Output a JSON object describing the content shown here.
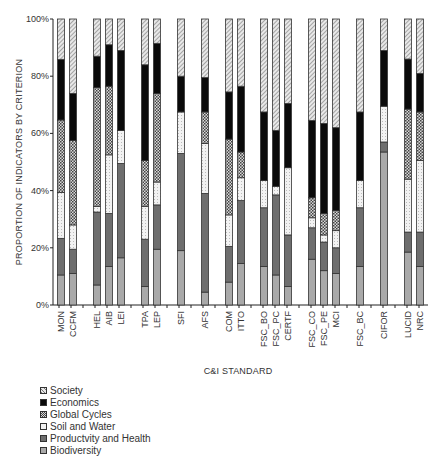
{
  "chart_data": {
    "type": "bar",
    "stacked": true,
    "normalized": true,
    "title": "",
    "xlabel": "C&I STANDARD",
    "ylabel": "PROPORTION OF INDICATORS BY CRITERION",
    "ylim": [
      0,
      100
    ],
    "yticks": [
      "0%",
      "20%",
      "40%",
      "60%",
      "80%",
      "100%"
    ],
    "grid": false,
    "legend_position": "bottom-left",
    "categories": [
      "MON",
      "CCFM",
      "HEL",
      "AIB",
      "LEI",
      "TPA",
      "LEP",
      "SFI",
      "AFS",
      "COM",
      "ITTO",
      "FSC_BO",
      "FSC_PC",
      "CERTF",
      "FSC_CO",
      "FSC_PE",
      "MCI",
      "FSC_BC",
      "CIFOR",
      "LUCID",
      "NRC"
    ],
    "series": [
      {
        "name": "Biodiversity",
        "values": [
          10.5,
          11,
          7,
          13.5,
          16.5,
          6.5,
          19.5,
          19,
          4.5,
          8,
          14.5,
          13.5,
          10.5,
          6.5,
          16,
          12,
          11,
          13.5,
          53.5,
          18.5,
          13.5
        ]
      },
      {
        "name": "Productvity and Health",
        "values": [
          12.8,
          8.5,
          25.5,
          18.5,
          33,
          16.5,
          15.5,
          34,
          34.5,
          12.5,
          22,
          20.5,
          28,
          18,
          11,
          10,
          9,
          20.5,
          3.5,
          7,
          12
        ]
      },
      {
        "name": "Soil and Water",
        "values": [
          16,
          8.5,
          2,
          20.5,
          11.5,
          11.5,
          8,
          14.5,
          17.5,
          11,
          8,
          9.5,
          3,
          23.5,
          3.5,
          2.5,
          6,
          9.5,
          12.5,
          18.5,
          25
        ]
      },
      {
        "name": "Global Cycles",
        "values": [
          25.4,
          29.5,
          41.5,
          24,
          0,
          16,
          31,
          0,
          11,
          26.5,
          9,
          0,
          0,
          0,
          7,
          7.5,
          7,
          0,
          0,
          24.5,
          17
        ]
      },
      {
        "name": "Economics",
        "values": [
          21.2,
          16.5,
          11,
          14.5,
          28,
          33.5,
          17.5,
          12.5,
          12,
          16.5,
          23,
          24,
          19.5,
          22.5,
          27,
          31.5,
          29,
          24,
          19.5,
          17.5,
          13.5
        ]
      },
      {
        "name": "Society",
        "values": [
          14.1,
          26,
          13,
          9,
          11,
          16,
          8.5,
          20,
          20.5,
          25.5,
          23.5,
          32.5,
          39,
          29.5,
          35.5,
          36.5,
          38,
          32.5,
          11,
          14,
          19
        ]
      }
    ],
    "legend_order": [
      "Society",
      "Economics",
      "Global Cycles",
      "Soil and Water",
      "Productvity and Health",
      "Biodiversity"
    ]
  },
  "style": {
    "colors": {
      "Biodiversity": "#a9a9a9",
      "Productvity and Health": "#6e6e6e",
      "Soil and Water": "#e6e6e6",
      "Global Cycles": "#8a8a8a",
      "Economics": "#0a0a0a",
      "Society": "#c8c8c8"
    },
    "patterns": {
      "Biodiversity": "solid",
      "Productvity and Health": "solid",
      "Soil and Water": "dots",
      "Global Cycles": "checker",
      "Economics": "solid",
      "Society": "diagonal"
    }
  },
  "layout": {
    "bar_x": [
      61,
      73,
      97,
      109,
      121,
      145,
      157,
      181,
      205,
      229,
      241,
      264,
      276,
      288,
      312,
      324,
      336,
      360,
      384,
      408,
      420
    ]
  }
}
